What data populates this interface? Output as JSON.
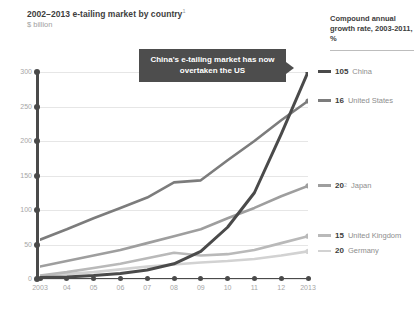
{
  "header": {
    "title": "2002–2013 e-tailing market by country",
    "title_superscript": "1",
    "subtitle": "$ billion"
  },
  "callout": {
    "text": "China's e-tailing market has now overtaken the US",
    "icon": "callout-arrow-right"
  },
  "legend": {
    "heading": "Compound annual growth rate, 2003-2011, %",
    "items": [
      {
        "value": "105",
        "name": "China",
        "superscript": "",
        "color": "#4a4a4a"
      },
      {
        "value": "16",
        "name": "United States",
        "superscript": "",
        "color": "#7c7c7c"
      },
      {
        "value": "20",
        "name": "Japan",
        "superscript": "2",
        "color": "#9e9e9e"
      },
      {
        "value": "15",
        "name": "United Kingdom",
        "superscript": "",
        "color": "#b9b9b9"
      },
      {
        "value": "20",
        "name": "Germany",
        "superscript": "",
        "color": "#d2d2d2"
      }
    ]
  },
  "chart_data": {
    "type": "line",
    "title": "2002–2013 e-tailing market by country",
    "subtitle": "$ billion",
    "xlabel": "",
    "ylabel": "$ billion",
    "grid": true,
    "legend_position": "right",
    "xlim": [
      2003,
      2013
    ],
    "ylim": [
      0,
      300
    ],
    "yticks": [
      0,
      50,
      100,
      150,
      200,
      250,
      300
    ],
    "ytick_labels": [
      "0",
      "50",
      "100",
      "150",
      "200",
      "250",
      "300"
    ],
    "x": [
      2003,
      2004,
      2005,
      2006,
      2007,
      2008,
      2009,
      2010,
      2011,
      2012,
      2013
    ],
    "xtick_labels": [
      "2003",
      "04",
      "05",
      "06",
      "07",
      "08",
      "09",
      "10",
      "11",
      "12",
      "2013"
    ],
    "series": [
      {
        "name": "China",
        "cagr": 105,
        "color": "#4a4a4a",
        "values": [
          2,
          3,
          5,
          8,
          13,
          22,
          40,
          75,
          125,
          210,
          300
        ]
      },
      {
        "name": "United States",
        "cagr": 16,
        "color": "#7c7c7c",
        "values": [
          57,
          72,
          88,
          103,
          118,
          140,
          143,
          172,
          200,
          230,
          258
        ]
      },
      {
        "name": "Japan",
        "cagr": 20,
        "color": "#9e9e9e",
        "values": [
          18,
          26,
          34,
          42,
          52,
          62,
          72,
          88,
          103,
          120,
          135
        ]
      },
      {
        "name": "United Kingdom",
        "cagr": 15,
        "color": "#b9b9b9",
        "values": [
          5,
          10,
          16,
          22,
          30,
          38,
          34,
          36,
          42,
          52,
          62
        ]
      },
      {
        "name": "Germany",
        "cagr": 20,
        "color": "#d2d2d2",
        "values": [
          4,
          7,
          10,
          14,
          18,
          21,
          24,
          26,
          29,
          34,
          40
        ]
      }
    ]
  }
}
